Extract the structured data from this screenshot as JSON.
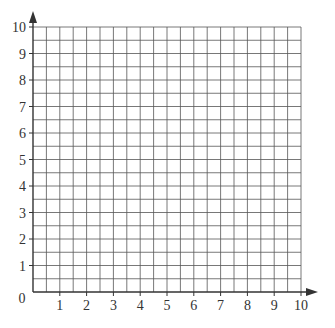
{
  "figure": {
    "type": "blank coordinate grid",
    "x_axis": {
      "min": 0,
      "max": 10,
      "labels": [
        "1",
        "2",
        "3",
        "4",
        "5",
        "6",
        "7",
        "8",
        "9",
        "10"
      ]
    },
    "y_axis": {
      "min": 0,
      "max": 10,
      "labels": [
        "1",
        "2",
        "3",
        "4",
        "5",
        "6",
        "7",
        "8",
        "9",
        "10"
      ]
    },
    "origin_label": "0",
    "minor_step": 0.5,
    "colors": {
      "grid": "#555555",
      "axis": "#333333",
      "label": "#333333"
    }
  }
}
